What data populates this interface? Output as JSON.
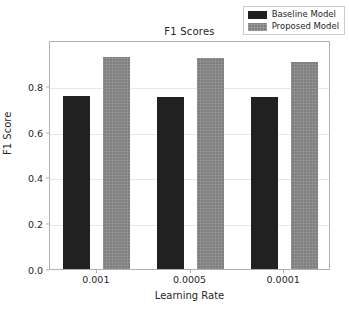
{
  "chart_data": {
    "type": "bar",
    "title": "F1 Scores",
    "xlabel": "Learning Rate",
    "ylabel": "F1 Score",
    "categories": [
      "0.001",
      "0.0005",
      "0.0001"
    ],
    "series": [
      {
        "name": "Baseline Model",
        "color": "#212121",
        "values": [
          0.757,
          0.753,
          0.75
        ]
      },
      {
        "name": "Proposed Model",
        "color": "#7f7f7f",
        "values": [
          0.928,
          0.92,
          0.903
        ]
      }
    ],
    "ylim": [
      0.0,
      1.0
    ],
    "yticks": [
      "0.0",
      "0.2",
      "0.4",
      "0.6",
      "0.8"
    ],
    "ytick_values": [
      0.0,
      0.2,
      0.4,
      0.6,
      0.8
    ],
    "grid": true,
    "legend_position": "upper right"
  },
  "legend": {
    "items": [
      {
        "label": "Baseline Model",
        "color": "#212121"
      },
      {
        "label": "Proposed Model",
        "color": "#7f7f7f"
      }
    ]
  },
  "axes": {
    "title": "F1 Scores",
    "xlabel": "Learning Rate",
    "ylabel": "F1 Score"
  }
}
